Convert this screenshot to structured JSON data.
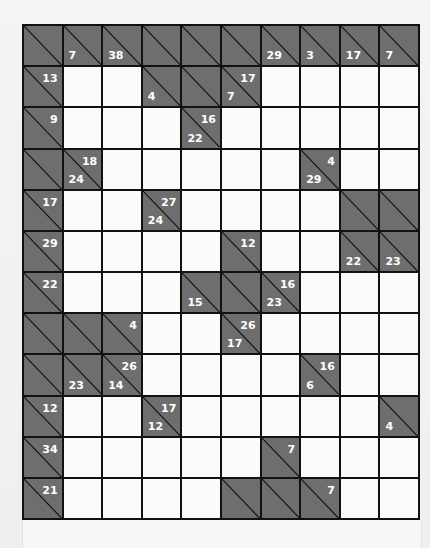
{
  "puzzle": {
    "type": "kakuro",
    "cols": 10,
    "rows": 12,
    "colors": {
      "block": "#6e6e6e",
      "line": "#111111",
      "white": "#fbfbfa",
      "clue_text": "#ffffff"
    },
    "grid": [
      [
        {
          "b": 1
        },
        {
          "b": 1,
          "d": "7"
        },
        {
          "b": 1,
          "d": "38"
        },
        {
          "b": 1
        },
        {
          "b": 1
        },
        {
          "b": 1
        },
        {
          "b": 1,
          "d": "29"
        },
        {
          "b": 1,
          "d": "3"
        },
        {
          "b": 1,
          "d": "17"
        },
        {
          "b": 1,
          "d": "7"
        }
      ],
      [
        {
          "b": 1,
          "a": "13"
        },
        {},
        {},
        {
          "b": 1,
          "d": "4"
        },
        {
          "b": 1
        },
        {
          "b": 1,
          "a": "17",
          "d": "7"
        },
        {},
        {},
        {},
        {}
      ],
      [
        {
          "b": 1,
          "a": "9"
        },
        {},
        {},
        {},
        {
          "b": 1,
          "a": "16",
          "d": "22"
        },
        {},
        {},
        {},
        {},
        {}
      ],
      [
        {
          "b": 1
        },
        {
          "b": 1,
          "a": "18",
          "d": "24"
        },
        {},
        {},
        {},
        {},
        {},
        {
          "b": 1,
          "a": "4",
          "d": "29"
        },
        {},
        {}
      ],
      [
        {
          "b": 1,
          "a": "17"
        },
        {},
        {},
        {
          "b": 1,
          "a": "27",
          "d": "24"
        },
        {},
        {},
        {},
        {},
        {
          "b": 1
        },
        {
          "b": 1
        }
      ],
      [
        {
          "b": 1,
          "a": "29"
        },
        {},
        {},
        {},
        {},
        {
          "b": 1,
          "a": "12"
        },
        {},
        {},
        {
          "b": 1,
          "d": "22"
        },
        {
          "b": 1,
          "d": "23"
        }
      ],
      [
        {
          "b": 1,
          "a": "22"
        },
        {},
        {},
        {},
        {
          "b": 1,
          "d": "15"
        },
        {
          "b": 1
        },
        {
          "b": 1,
          "a": "16",
          "d": "23"
        },
        {},
        {},
        {}
      ],
      [
        {
          "b": 1
        },
        {
          "b": 1
        },
        {
          "b": 1,
          "a": "4"
        },
        {},
        {},
        {
          "b": 1,
          "a": "26",
          "d": "17"
        },
        {},
        {},
        {},
        {}
      ],
      [
        {
          "b": 1
        },
        {
          "b": 1,
          "d": "23"
        },
        {
          "b": 1,
          "a": "26",
          "d": "14"
        },
        {},
        {},
        {},
        {},
        {
          "b": 1,
          "a": "16",
          "d": "6"
        },
        {},
        {}
      ],
      [
        {
          "b": 1,
          "a": "12"
        },
        {},
        {},
        {
          "b": 1,
          "a": "17",
          "d": "12"
        },
        {},
        {},
        {},
        {},
        {},
        {
          "b": 1,
          "d": "4"
        }
      ],
      [
        {
          "b": 1,
          "a": "34"
        },
        {},
        {},
        {},
        {},
        {},
        {
          "b": 1,
          "a": "7"
        },
        {},
        {},
        {}
      ],
      [
        {
          "b": 1,
          "a": "21"
        },
        {},
        {},
        {},
        {},
        {
          "b": 1
        },
        {
          "b": 1
        },
        {
          "b": 1,
          "a": "7"
        },
        {},
        {}
      ]
    ]
  }
}
